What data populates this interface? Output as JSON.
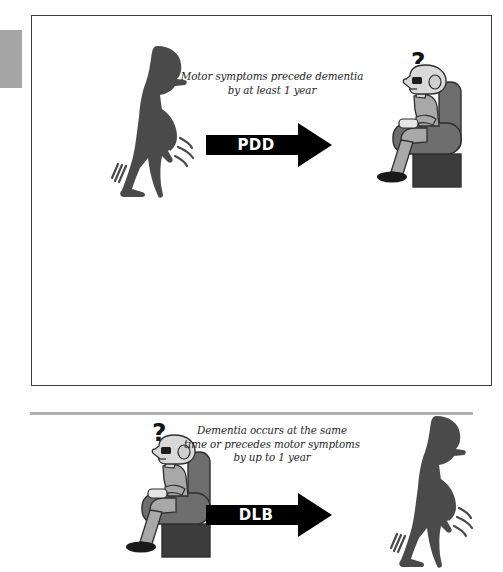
{
  "figure": {
    "rows": [
      {
        "id": "pdd",
        "caption": "Motor symptoms precede dementia by at least 1 year",
        "caption_lines": [
          "Motor symptoms precede dementia",
          "by at least 1 year"
        ],
        "arrow_label": "PDD",
        "left_scene": "standing-tremor-silhouette",
        "right_scene": "seated-elderly-in-armchair",
        "question_mark": "?"
      },
      {
        "id": "dlb",
        "caption": "Dementia occurs at the same time or precedes motor symptoms by up to 1 year",
        "caption_lines": [
          "Dementia occurs at the same",
          "time or precedes motor symptoms",
          "by up to 1 year"
        ],
        "arrow_label": "DLB",
        "left_scene": "seated-elderly-in-armchair",
        "right_scene": "standing-tremor-silhouette",
        "question_mark": "?"
      }
    ]
  },
  "colors": {
    "frame_border": "#3a3a3a",
    "arrow_fill": "#000000",
    "arrow_text": "#ffffff",
    "caption_text": "#1e1e1e",
    "silhouette": "#4a4a4a",
    "chair_body": "#6e6e6e",
    "chair_base": "#3c3c3c",
    "skin": "#d9d9d9",
    "clothing": "#a8a8a8",
    "page_background": "#ffffff",
    "edge_tab": "#a6a6a6",
    "bottom_rule": "#b0b0b0"
  }
}
